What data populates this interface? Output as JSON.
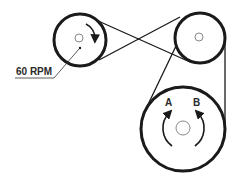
{
  "diagram": {
    "labels": {
      "speed": "60 RPM",
      "direction_a": "A",
      "direction_b": "B"
    },
    "pulleys": [
      {
        "name": "drive-pulley",
        "cx": 80,
        "cy": 40,
        "r": 26,
        "hub_r": 4
      },
      {
        "name": "idler-pulley",
        "cx": 200,
        "cy": 38,
        "r": 25,
        "hub_r": 4
      },
      {
        "name": "driven-pulley",
        "cx": 183,
        "cy": 129,
        "r": 42,
        "hub_r": 7
      }
    ],
    "colors": {
      "stroke": "#1a1a1a",
      "hub": "#777777",
      "background": "#ffffff"
    }
  }
}
